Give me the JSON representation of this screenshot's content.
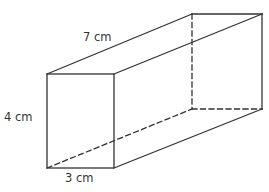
{
  "figure": {
    "type": "cuboid",
    "colors": {
      "line": "#333333",
      "text": "#333333",
      "background": "#ffffff"
    },
    "dimensions": {
      "length": {
        "value": 7,
        "unit": "cm",
        "label": "7 cm"
      },
      "height": {
        "value": 4,
        "unit": "cm",
        "label": "4 cm"
      },
      "width": {
        "value": 3,
        "unit": "cm",
        "label": "3 cm"
      }
    },
    "edges": {
      "visible_count": 9,
      "hidden_count": 3
    }
  }
}
